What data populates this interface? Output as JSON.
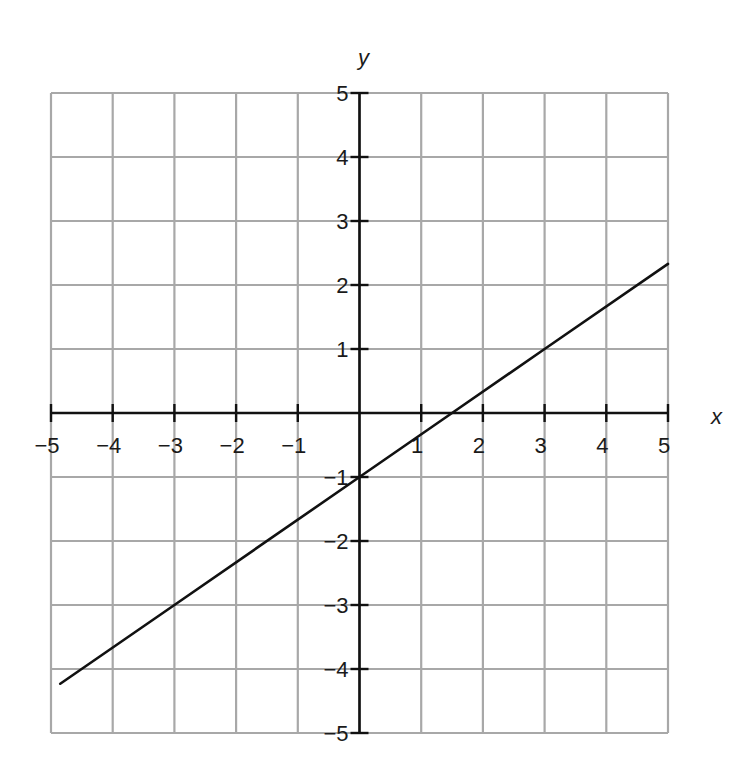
{
  "chart_data": {
    "type": "line",
    "title": "",
    "xlabel": "x",
    "ylabel": "y",
    "xlim": [
      -5,
      5
    ],
    "ylim": [
      -5,
      5
    ],
    "grid": true,
    "x_ticks": [
      -5,
      -4,
      -3,
      -2,
      -1,
      1,
      2,
      3,
      4,
      5
    ],
    "y_ticks": [
      5,
      4,
      3,
      2,
      1,
      -1,
      -2,
      -3,
      -4,
      -5
    ],
    "x_tick_labels": [
      "−5",
      "−4",
      "−3",
      "−2",
      "−1",
      "1",
      "2",
      "3",
      "4",
      "5"
    ],
    "y_tick_labels": [
      "5",
      "4",
      "3",
      "2",
      "1",
      "−1",
      "−2",
      "−3",
      "−4",
      "−5"
    ],
    "series": [
      {
        "name": "line",
        "equation": "y = (2/3)x - 1",
        "slope": 0.6667,
        "intercept": -1,
        "x": [
          -4.85,
          -3,
          0,
          1.5,
          3,
          5
        ],
        "y": [
          -4.23,
          -3,
          -1,
          0,
          1,
          2.33
        ]
      }
    ],
    "legend": null
  },
  "colors": {
    "grid": "#a8a8a8",
    "axis": "#111111",
    "line": "#111111",
    "background": "#ffffff"
  }
}
